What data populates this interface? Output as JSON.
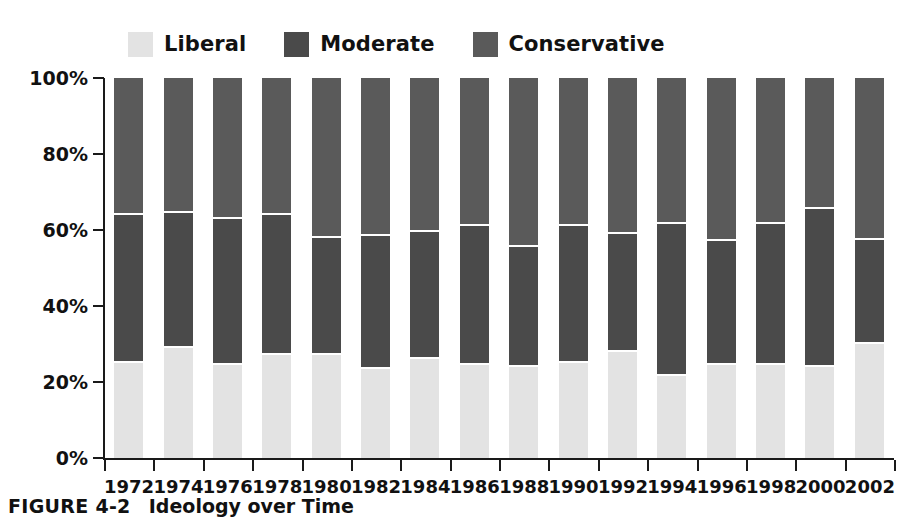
{
  "caption": {
    "number": "FIGURE 4-2",
    "title": "Ideology over Time"
  },
  "colors": {
    "liberal": "#e3e3e3",
    "moderate": "#4d4d4d",
    "conservative": "#555555",
    "axis": "#1a1a1a",
    "text": "#111111",
    "background": "#ffffff"
  },
  "legend": {
    "position": "top-left",
    "items": [
      {
        "label": "Liberal",
        "color": "#e3e3e3"
      },
      {
        "label": "Moderate",
        "color": "#4a4a4a"
      },
      {
        "label": "Conservative",
        "color": "#5a5a5a"
      }
    ]
  },
  "axes": {
    "y": {
      "ticks": [
        "0%",
        "20%",
        "40%",
        "60%",
        "80%",
        "100%"
      ],
      "min": 0,
      "max": 100
    },
    "x": {
      "label": ""
    }
  },
  "chart_data": {
    "type": "bar",
    "subtype": "stacked-100-percent",
    "title": "Ideology over Time",
    "xlabel": "",
    "ylabel": "",
    "ylim": [
      0,
      100
    ],
    "ytick_labels": [
      "0%",
      "20%",
      "40%",
      "60%",
      "80%",
      "100%"
    ],
    "ytick_values": [
      0,
      20,
      40,
      60,
      80,
      100
    ],
    "grid": false,
    "legend_position": "top-left",
    "stack_order_bottom_to_top": [
      "Liberal",
      "Moderate",
      "Conservative"
    ],
    "categories": [
      "1972",
      "1974",
      "1976",
      "1978",
      "1980",
      "1982",
      "1984",
      "1986",
      "1988",
      "1990",
      "1992",
      "1994",
      "1996",
      "1998",
      "2000",
      "2002"
    ],
    "series": [
      {
        "name": "Liberal",
        "color": "#e3e3e3",
        "values": [
          25,
          29,
          24.5,
          27,
          27,
          23.5,
          26,
          24.5,
          24,
          25,
          28,
          21.5,
          24.5,
          24.5,
          24,
          30
        ]
      },
      {
        "name": "Moderate",
        "color": "#4a4a4a",
        "values": [
          39,
          35.5,
          38.5,
          37,
          31,
          35,
          33.5,
          36.5,
          31.5,
          36,
          31,
          40,
          32.5,
          37,
          41.5,
          27.5
        ]
      },
      {
        "name": "Conservative",
        "color": "#5a5a5a",
        "values": [
          36,
          35.5,
          37,
          36,
          42,
          41.5,
          40.5,
          39,
          44.5,
          39,
          41,
          38.5,
          43,
          38.5,
          34.5,
          42.5
        ]
      }
    ],
    "segment_tops_percent": {
      "liberal_top": [
        25,
        29,
        24.5,
        27,
        27,
        23.5,
        26,
        24.5,
        24,
        25,
        28,
        21.5,
        24.5,
        24.5,
        24,
        30
      ],
      "moderate_top": [
        64,
        64.5,
        63,
        64,
        58,
        58.5,
        59.5,
        61,
        55.5,
        61,
        59,
        61.5,
        57,
        61.5,
        65.5,
        57.5
      ]
    }
  }
}
